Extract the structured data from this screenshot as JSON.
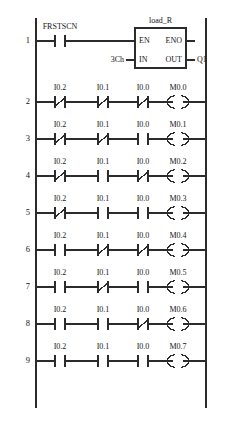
{
  "diagram": {
    "rail_color": "#2b2b2b",
    "wire_color": "#2b2b2b",
    "text_color": "#141414",
    "background": "#ffffff"
  },
  "rungs": [
    {
      "number": "1",
      "type": "function_block",
      "contacts": [
        {
          "label": "FRSTSCN",
          "kind": "no"
        }
      ],
      "block": {
        "name": "load_R",
        "en": "EN",
        "eno": "ENO",
        "in": "IN",
        "out": "OUT",
        "in_operand": "3Ch",
        "out_operand": "Q1"
      }
    },
    {
      "number": "2",
      "type": "contacts",
      "contacts": [
        {
          "label": "I0.2",
          "kind": "nc"
        },
        {
          "label": "I0.1",
          "kind": "nc"
        },
        {
          "label": "I0.0",
          "kind": "nc"
        }
      ],
      "coil": {
        "label": "M0.0",
        "kind": "coil"
      }
    },
    {
      "number": "3",
      "type": "contacts",
      "contacts": [
        {
          "label": "I0.2",
          "kind": "nc"
        },
        {
          "label": "I0.1",
          "kind": "nc"
        },
        {
          "label": "I0.0",
          "kind": "no"
        }
      ],
      "coil": {
        "label": "M0.1",
        "kind": "coil"
      }
    },
    {
      "number": "4",
      "type": "contacts",
      "contacts": [
        {
          "label": "I0.2",
          "kind": "nc"
        },
        {
          "label": "I0.1",
          "kind": "no"
        },
        {
          "label": "I0.0",
          "kind": "nc"
        }
      ],
      "coil": {
        "label": "M0.2",
        "kind": "coil"
      }
    },
    {
      "number": "5",
      "type": "contacts",
      "contacts": [
        {
          "label": "I0.2",
          "kind": "nc"
        },
        {
          "label": "I0.1",
          "kind": "no"
        },
        {
          "label": "I0.0",
          "kind": "no"
        }
      ],
      "coil": {
        "label": "M0.3",
        "kind": "coil"
      }
    },
    {
      "number": "6",
      "type": "contacts",
      "contacts": [
        {
          "label": "I0.2",
          "kind": "no"
        },
        {
          "label": "I0.1",
          "kind": "nc"
        },
        {
          "label": "I0.0",
          "kind": "nc"
        }
      ],
      "coil": {
        "label": "M0.4",
        "kind": "coil"
      }
    },
    {
      "number": "7",
      "type": "contacts",
      "contacts": [
        {
          "label": "I0.2",
          "kind": "no"
        },
        {
          "label": "I0.1",
          "kind": "nc"
        },
        {
          "label": "I0.0",
          "kind": "no"
        }
      ],
      "coil": {
        "label": "M0.5",
        "kind": "coil"
      }
    },
    {
      "number": "8",
      "type": "contacts",
      "contacts": [
        {
          "label": "I0.2",
          "kind": "no"
        },
        {
          "label": "I0.1",
          "kind": "no"
        },
        {
          "label": "I0.0",
          "kind": "nc"
        }
      ],
      "coil": {
        "label": "M0.6",
        "kind": "coil"
      }
    },
    {
      "number": "9",
      "type": "contacts",
      "contacts": [
        {
          "label": "I0.2",
          "kind": "no"
        },
        {
          "label": "I0.1",
          "kind": "no"
        },
        {
          "label": "I0.0",
          "kind": "no"
        }
      ],
      "coil": {
        "label": "M0.7",
        "kind": "coil"
      }
    }
  ]
}
